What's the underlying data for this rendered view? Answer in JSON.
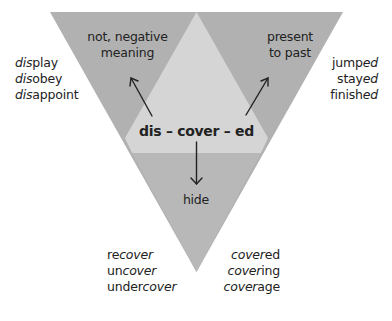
{
  "diagram": {
    "colors": {
      "dark_region": "#b1b1b1",
      "light_region": "#d4d4d4",
      "bottom_region": "#b7b7b7",
      "text": "#222222",
      "arrow": "#222222"
    },
    "center_word": "dis – cover – ed",
    "regions": {
      "top_left": {
        "label_line1": "not, negative",
        "label_line2": "meaning"
      },
      "top_right": {
        "label_line1": "present",
        "label_line2": "to past"
      },
      "bottom": {
        "label": "hide"
      }
    },
    "examples": {
      "left": [
        {
          "prefix": "dis",
          "rest": "play",
          "italic_part": "prefix"
        },
        {
          "prefix": "dis",
          "rest": "obey",
          "italic_part": "prefix"
        },
        {
          "prefix": "dis",
          "rest": "appoint",
          "italic_part": "prefix"
        }
      ],
      "right": [
        {
          "stem": "jump",
          "suffix": "ed",
          "italic_part": "suffix"
        },
        {
          "stem": "stay",
          "suffix": "ed",
          "italic_part": "suffix"
        },
        {
          "stem": "finish",
          "suffix": "ed",
          "italic_part": "suffix"
        }
      ],
      "bottom_left": [
        {
          "prefix": "re",
          "root": "cover",
          "italic_part": "root"
        },
        {
          "prefix": "un",
          "root": "cover",
          "italic_part": "root"
        },
        {
          "prefix": "under",
          "root": "cover",
          "italic_part": "root"
        }
      ],
      "bottom_right": [
        {
          "root": "cover",
          "suffix": "ed",
          "italic_part": "root"
        },
        {
          "root": "cover",
          "suffix": "ing",
          "italic_part": "root"
        },
        {
          "root": "cover",
          "suffix": "age",
          "italic_part": "root"
        }
      ]
    }
  }
}
